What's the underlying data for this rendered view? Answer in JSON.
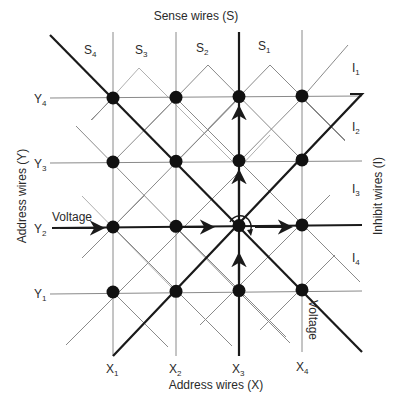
{
  "title_top": "Sense wires (S)",
  "title_bottom": "Address wires (X)",
  "title_left": "Address wires (Y)",
  "title_right": "Inhibit wires (I)",
  "sense_labels": [
    {
      "base": "S",
      "sub": "4"
    },
    {
      "base": "S",
      "sub": "3"
    },
    {
      "base": "S",
      "sub": "2"
    },
    {
      "base": "S",
      "sub": "1"
    }
  ],
  "inhibit_labels": [
    {
      "base": "I",
      "sub": "1"
    },
    {
      "base": "I",
      "sub": "2"
    },
    {
      "base": "I",
      "sub": "3"
    },
    {
      "base": "I",
      "sub": "4"
    }
  ],
  "x_labels": [
    {
      "base": "X",
      "sub": "1"
    },
    {
      "base": "X",
      "sub": "2"
    },
    {
      "base": "X",
      "sub": "3"
    },
    {
      "base": "X",
      "sub": "4"
    }
  ],
  "y_labels": [
    {
      "base": "Y",
      "sub": "4"
    },
    {
      "base": "Y",
      "sub": "3"
    },
    {
      "base": "Y",
      "sub": "2"
    },
    {
      "base": "Y",
      "sub": "1"
    }
  ],
  "voltage_label_y": "Voltage",
  "voltage_label_x": "Voltage",
  "grid": {
    "columns": 4,
    "rows": 4
  },
  "selected_core": {
    "x": "X3",
    "y": "Y2"
  },
  "energized_wires": [
    "X3",
    "Y2"
  ]
}
